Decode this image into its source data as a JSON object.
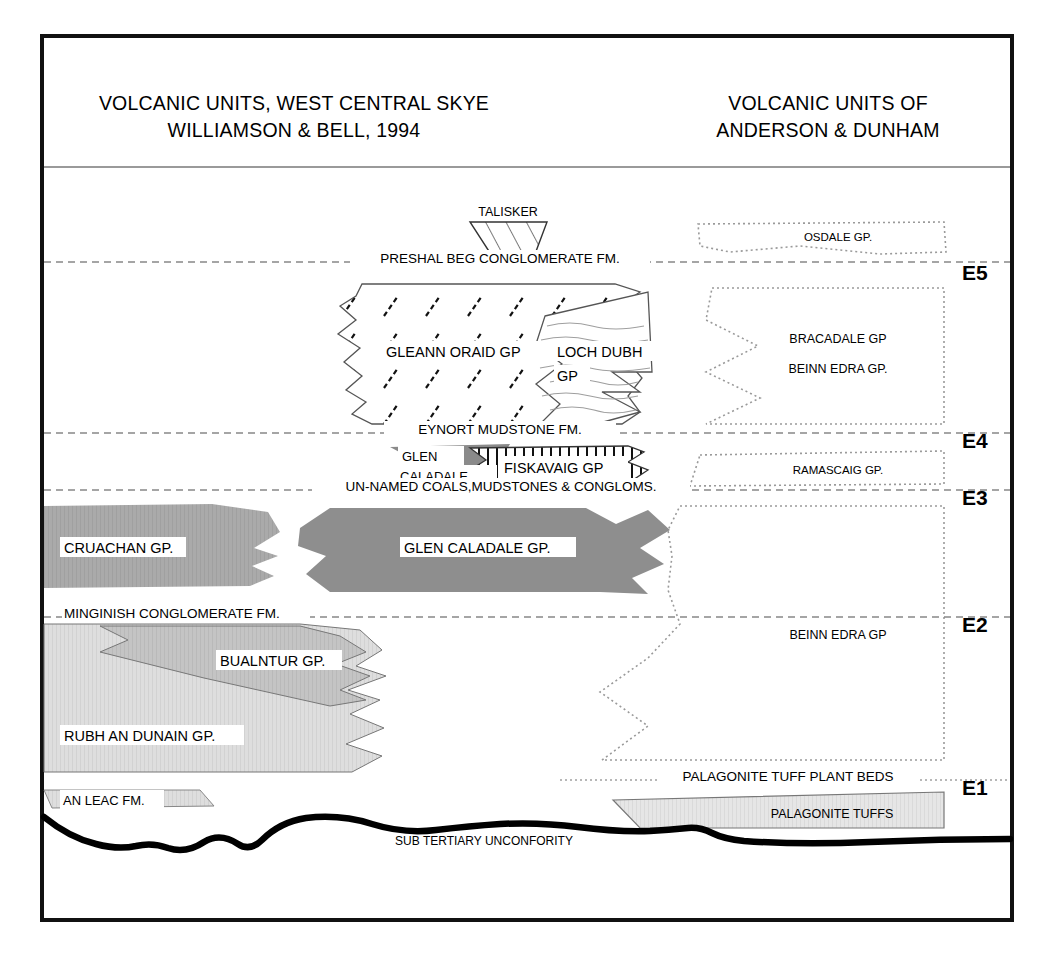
{
  "figure": {
    "kind": "stratigraphic-correlation-diagram",
    "frame_border_color": "#111111",
    "background": "#ffffff"
  },
  "header": {
    "left_title_line1": "VOLCANIC UNITS, WEST CENTRAL SKYE",
    "left_title_line2": "WILLIAMSON & BELL, 1994",
    "right_title_line1": "VOLCANIC UNITS OF",
    "right_title_line2": "ANDERSON & DUNHAM"
  },
  "era_labels": [
    {
      "label": "E5",
      "y": 272
    },
    {
      "label": "E4",
      "y": 440
    },
    {
      "label": "E3",
      "y": 497
    },
    {
      "label": "E2",
      "y": 624
    },
    {
      "label": "E1",
      "y": 787
    }
  ],
  "boundary_lines": [
    {
      "name": "preshal-beg-conglomerate-fm",
      "label": "PRESHAL BEG CONGLOMERATE FM.",
      "y": 262,
      "style": "dashed"
    },
    {
      "name": "eynort-mudstone-fm",
      "label": "EYNORT MUDSTONE FM.",
      "y": 433,
      "style": "dashed"
    },
    {
      "name": "un-named-coals-mudstones-congloms",
      "label": "UN-NAMED COALS,MUDSTONES & CONGLOMS.",
      "y": 490,
      "style": "dashed"
    },
    {
      "name": "minginish-conglomerate-fm",
      "label": "MINGINISH CONGLOMERATE FM.",
      "y": 617,
      "style": "dashed"
    },
    {
      "name": "palagonite-tuff-plant-beds",
      "label": "PALAGONITE TUFF PLANT BEDS",
      "y": 780,
      "style": "dotted"
    }
  ],
  "left_column_units": [
    {
      "name": "talisker",
      "label": "TALISKER",
      "fill": "#ffffff",
      "pattern": "diagonal-hatch"
    },
    {
      "name": "gleann-oraid-gp",
      "label": "GLEANN ORAID GP",
      "fill": "#ffffff",
      "pattern": "dashed-diagonal-ticks"
    },
    {
      "name": "loch-dubh-gp",
      "label_line1": "LOCH DUBH",
      "label_line2": "GP",
      "fill": "#ffffff",
      "pattern": "wavy-horizontal-lines"
    },
    {
      "name": "glen-caladale-upper",
      "label_line1": "GLEN",
      "label_line2": "CALADALE",
      "fill": "#8a8a8a",
      "pattern": "solid-grey"
    },
    {
      "name": "fiskavaig-gp",
      "label": "FISKAVAIG GP",
      "fill": "#ffffff",
      "pattern": "vertical-lines"
    },
    {
      "name": "cruachan-gp",
      "label": "CRUACHAN GP.",
      "fill": "#a8a8a8",
      "pattern": "solid-grey"
    },
    {
      "name": "glen-caladale-gp",
      "label": "GLEN CALADALE GP.",
      "fill": "#8e8e8e",
      "pattern": "solid-grey"
    },
    {
      "name": "bualntur-gp",
      "label": "BUALNTUR GP.",
      "fill": "#c2c2c2",
      "pattern": "solid-grey"
    },
    {
      "name": "rubh-an-dunain-gp",
      "label": "RUBH AN DUNAIN GP.",
      "fill": "#dcdcdc",
      "pattern": "solid-grey"
    },
    {
      "name": "an-leac-fm",
      "label": "AN LEAC FM.",
      "fill": "#dcdcdc",
      "pattern": "solid-grey"
    }
  ],
  "right_column_units": [
    {
      "name": "osdale-gp",
      "label": "OSDALE GP.",
      "fill": "#ffffff",
      "outline": "dotted"
    },
    {
      "name": "bracadale-gp",
      "label": "BRACADALE GP",
      "fill": "#ffffff",
      "outline": "dotted"
    },
    {
      "name": "beinn-edra-gp-upper",
      "label": "BEINN EDRA GP.",
      "fill": "#ffffff",
      "outline": "dotted"
    },
    {
      "name": "ramascaig-gp",
      "label": "RAMASCAIG GP.",
      "fill": "#ffffff",
      "outline": "dotted"
    },
    {
      "name": "beinn-edra-gp",
      "label": "BEINN EDRA GP",
      "fill": "#ffffff",
      "outline": "dotted"
    },
    {
      "name": "palagonite-tuffs",
      "label": "PALAGONITE TUFFS",
      "fill": "#e4e4e4",
      "outline": "solid"
    }
  ],
  "unconformity": {
    "name": "sub-tertiary-unconformity",
    "label": "SUB TERTIARY UNCONFORITY",
    "line_color": "#000000",
    "line_width": 6
  },
  "colors": {
    "grey_dark": "#8a8a8a",
    "grey_mid": "#a8a8a8",
    "grey_light": "#c2c2c2",
    "grey_pale": "#dcdcdc",
    "grey_faint": "#e4e4e4",
    "outline": "#555555",
    "dotted_outline": "#9a9a9a"
  }
}
